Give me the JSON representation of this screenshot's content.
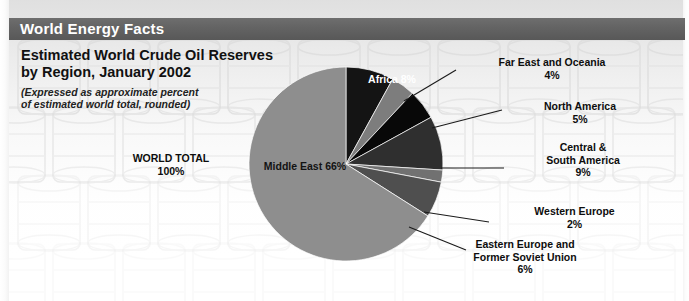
{
  "header": {
    "title": "World Energy Facts"
  },
  "title_block": {
    "line1": "Estimated World Crude Oil Reserves",
    "line2": "by Region, January 2002",
    "sub1": "(Expressed as approximate percent",
    "sub2": "of estimated world total, rounded)"
  },
  "world_total": {
    "label": "WORLD TOTAL",
    "value": "100%"
  },
  "labels": {
    "middle_east": {
      "name": "Middle East",
      "pct": "66%"
    },
    "africa": {
      "name": "Africa",
      "pct": "8%"
    },
    "far_east": {
      "name": "Far East and Oceania",
      "pct": "4%"
    },
    "north_america": {
      "name": "North America",
      "pct": "5%"
    },
    "central_south_america": {
      "name1": "Central &",
      "name2": "South America",
      "pct": "9%"
    },
    "western_europe": {
      "name": "Western Europe",
      "pct": "2%"
    },
    "eastern_europe": {
      "name1": "Eastern Europe and",
      "name2": "Former Soviet Union",
      "pct": "6%"
    }
  },
  "colors": {
    "header_bar": "#646464",
    "middle_east": "#8e8e8e",
    "africa": "#141414",
    "far_east": "#7d7d7d",
    "north_america": "#080808",
    "central_south_america": "#2f2f2f",
    "western_europe": "#717171",
    "eastern_europe": "#4f4f4f",
    "leader_line": "#1a1a1a",
    "background": "#ffffff"
  },
  "chart_data": {
    "type": "pie",
    "title": "Estimated World Crude Oil Reserves by Region, January 2002",
    "subtitle": "(Expressed as approximate percent of estimated world total, rounded)",
    "unit": "percent of estimated world total",
    "total_label": "WORLD TOTAL",
    "total_value": 100,
    "legend": "none",
    "labels_inside": [
      "Middle East",
      "Africa"
    ],
    "start_angle_deg": 0,
    "direction": "clockwise",
    "categories": [
      "Africa",
      "Far East and Oceania",
      "North America",
      "Central & South America",
      "Western Europe",
      "Eastern Europe and Former Soviet Union",
      "Middle East"
    ],
    "values": [
      8,
      4,
      5,
      9,
      2,
      6,
      66
    ],
    "slices": [
      {
        "label": "Africa",
        "value": 8,
        "display": "8%",
        "color": "#141414",
        "label_position": "inside"
      },
      {
        "label": "Far East and Oceania",
        "value": 4,
        "display": "4%",
        "color": "#7d7d7d",
        "label_position": "callout"
      },
      {
        "label": "North America",
        "value": 5,
        "display": "5%",
        "color": "#080808",
        "label_position": "callout"
      },
      {
        "label": "Central & South America",
        "value": 9,
        "display": "9%",
        "color": "#2f2f2f",
        "label_position": "callout"
      },
      {
        "label": "Western Europe",
        "value": 2,
        "display": "2%",
        "color": "#717171",
        "label_position": "callout"
      },
      {
        "label": "Eastern Europe and Former Soviet Union",
        "value": 6,
        "display": "6%",
        "color": "#4f4f4f",
        "label_position": "callout"
      },
      {
        "label": "Middle East",
        "value": 66,
        "display": "66%",
        "color": "#8e8e8e",
        "label_position": "inside"
      }
    ]
  }
}
